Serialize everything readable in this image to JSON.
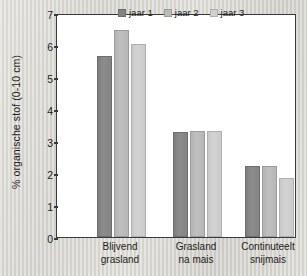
{
  "chart_data": {
    "type": "bar",
    "title": "",
    "xlabel": "",
    "ylabel": "% organische stof (0-10 cm)",
    "ylim": [
      0,
      7
    ],
    "yticks": [
      "0",
      "1",
      "2",
      "3",
      "4",
      "5",
      "6",
      "7"
    ],
    "grid": false,
    "legend_position": "top-right",
    "categories": [
      "Blijvend grasland",
      "Grasland na mais",
      "Continuteelt snijmais"
    ],
    "category_lines": [
      [
        "Blijvend",
        "grasland"
      ],
      [
        "Grasland",
        "na mais"
      ],
      [
        "Continuteelt",
        "snijmais"
      ]
    ],
    "series": [
      {
        "name": "jaar 1",
        "color": "#838383",
        "values": [
          5.66,
          3.27,
          2.23
        ]
      },
      {
        "name": "jaar 2",
        "color": "#bababa",
        "values": [
          6.47,
          3.32,
          2.22
        ]
      },
      {
        "name": "jaar 3",
        "color": "#cfcfcf",
        "values": [
          6.03,
          3.3,
          1.84
        ]
      }
    ]
  }
}
